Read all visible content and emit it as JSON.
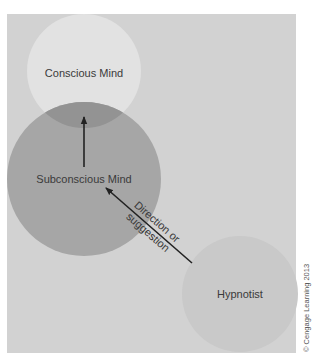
{
  "diagram": {
    "colors": {
      "page_background": "#ffffff",
      "panel_background": "#d2d2d2",
      "conscious_fill": "#e2e2e2",
      "subconscious_fill": "#a6a6a6",
      "overlap_fill": "#939393",
      "hypnotist_fill": "#c9c9c9",
      "arrow_color": "#222222",
      "text_color": "#3a3a3a"
    },
    "nodes": [
      {
        "id": "conscious",
        "label": "Conscious Mind"
      },
      {
        "id": "subconscious",
        "label": "Subconscious Mind"
      },
      {
        "id": "hypnotist",
        "label": "Hypnotist"
      }
    ],
    "edges": [
      {
        "from": "subconscious",
        "to": "conscious",
        "label": ""
      },
      {
        "from": "hypnotist",
        "to": "subconscious",
        "label_line1": "Direction or",
        "label_line2": "suggestion"
      }
    ],
    "credit": "© Cengage Learning 2013"
  }
}
